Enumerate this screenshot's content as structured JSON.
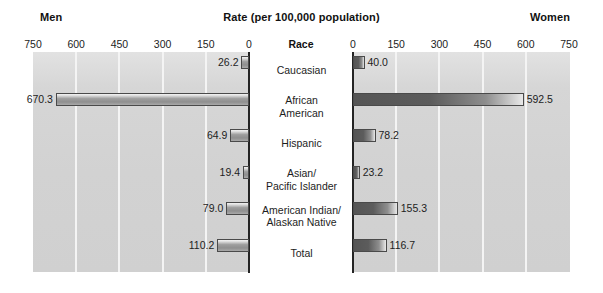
{
  "header": {
    "left_title": "Men",
    "center_title": "Rate (per 100,000 population)",
    "right_title": "Women"
  },
  "axis": {
    "category_header": "Race",
    "left_ticks": [
      "750",
      "600",
      "450",
      "300",
      "150",
      "0"
    ],
    "right_ticks": [
      "0",
      "150",
      "300",
      "450",
      "600",
      "750"
    ]
  },
  "chart_data": {
    "type": "bar",
    "orientation": "horizontal",
    "style": "bidirectional-population-pyramid",
    "title": "Rate (per 100,000 population)",
    "xlabel": "Rate (per 100,000 population)",
    "ylabel": "Race",
    "categories": [
      "Caucasian",
      "African American",
      "Hispanic",
      "Asian/ Pacific Islander",
      "American Indian/ Alaskan Native",
      "Total"
    ],
    "category_display": [
      "Caucasian",
      "African\nAmerican",
      "Hispanic",
      "Asian/\nPacific Islander",
      "American Indian/\nAlaskan Native",
      "Total"
    ],
    "series": [
      {
        "name": "Men",
        "side": "left",
        "values": [
          26.2,
          670.3,
          64.9,
          19.4,
          79.0,
          110.2
        ]
      },
      {
        "name": "Women",
        "side": "right",
        "values": [
          40.0,
          592.5,
          78.2,
          23.2,
          155.3,
          116.7
        ]
      }
    ],
    "value_labels_left": [
      "26.2",
      "670.3",
      "64.9",
      "19.4",
      "79.0",
      "110.2"
    ],
    "value_labels_right": [
      "40.0",
      "592.5",
      "78.2",
      "23.2",
      "155.3",
      "116.7"
    ],
    "xlim": [
      0,
      750
    ],
    "tick_step": 150,
    "gridlines": [
      150,
      300,
      450,
      600
    ],
    "grid": true,
    "legend": "none",
    "colors": {
      "plot_background": "#d2d2d2",
      "gridline": "#f4f4f4",
      "axis": "#242424",
      "left_bar": "#9e9e9e",
      "right_bar": "#5c5c5c",
      "text": "#1d1d1d"
    }
  }
}
